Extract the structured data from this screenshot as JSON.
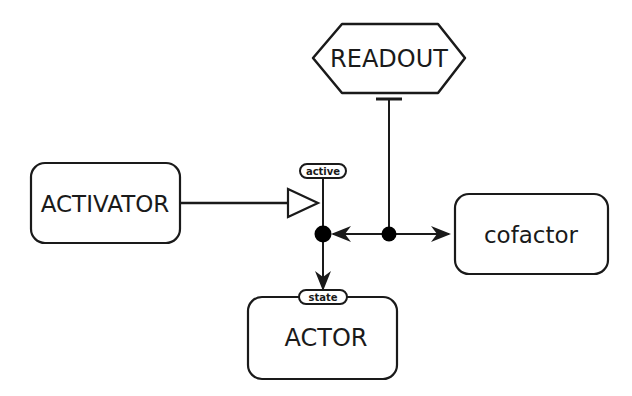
{
  "diagram": {
    "type": "SBGN process description",
    "nodes": {
      "readout": {
        "label": "READOUT",
        "shape": "hexagon"
      },
      "activator": {
        "label": "ACTIVATOR",
        "shape": "rounded-rectangle"
      },
      "cofactor": {
        "label": "cofactor",
        "shape": "rounded-rectangle"
      },
      "actor": {
        "label": "ACTOR",
        "shape": "rounded-rectangle",
        "state_variable": "state"
      }
    },
    "process_port": {
      "state_label": "active"
    },
    "edges": [
      {
        "from": "activator",
        "to": "process",
        "type": "stimulation",
        "arrowhead": "open-triangle"
      },
      {
        "from": "readout",
        "to": "association",
        "type": "inhibition",
        "arrowhead": "t-bar"
      },
      {
        "from": "association",
        "to": "process",
        "type": "production",
        "arrowhead": "filled-arrow"
      },
      {
        "from": "association",
        "to": "cofactor",
        "type": "production",
        "arrowhead": "filled-arrow"
      },
      {
        "from": "process",
        "to": "actor",
        "type": "production",
        "arrowhead": "filled-arrow"
      }
    ],
    "colors": {
      "stroke": "#1a1a1a",
      "fill": "#ffffff",
      "background": "#ffffff"
    }
  }
}
